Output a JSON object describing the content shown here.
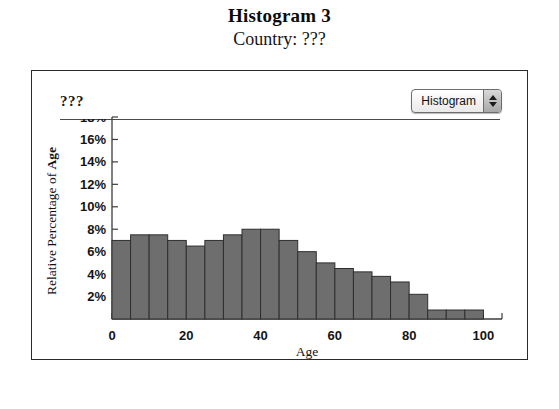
{
  "figure": {
    "title": "Histogram 3",
    "subtitle": "Country: ???"
  },
  "panel": {
    "dataset_label": "???",
    "chart_type_select": {
      "value": "Histogram",
      "stepper_up_icon": "triangle-up-icon",
      "stepper_down_icon": "triangle-down-icon"
    }
  },
  "chart_data": {
    "type": "bar",
    "title": "Histogram 3",
    "subtitle": "Country: ???",
    "xlabel": "Age",
    "ylabel": "Relative Percentage of Age",
    "ylabel_plain": "Relative Percentage of ",
    "ylabel_bold": "Age",
    "grid": false,
    "legend": "none",
    "bin_width": 5,
    "xlim": [
      0,
      105
    ],
    "ylim": [
      0,
      18
    ],
    "xticks": [
      0,
      20,
      40,
      60,
      80,
      100
    ],
    "xtick_labels": [
      "0",
      "20",
      "40",
      "60",
      "80",
      "100"
    ],
    "yticks": [
      2,
      4,
      6,
      8,
      10,
      12,
      14,
      16,
      18
    ],
    "ytick_labels": [
      "2%",
      "4%",
      "6%",
      "8%",
      "10%",
      "12%",
      "14%",
      "16%",
      "18%"
    ],
    "ytick_clipped": "18%",
    "categories": [
      "0-5",
      "5-10",
      "10-15",
      "15-20",
      "20-25",
      "25-30",
      "30-35",
      "35-40",
      "40-45",
      "45-50",
      "50-55",
      "55-60",
      "60-65",
      "65-70",
      "70-75",
      "75-80",
      "80-85",
      "85-90",
      "90-95",
      "95-100"
    ],
    "bin_starts": [
      0,
      5,
      10,
      15,
      20,
      25,
      30,
      35,
      40,
      45,
      50,
      55,
      60,
      65,
      70,
      75,
      80,
      85,
      90,
      95
    ],
    "values": [
      7.0,
      7.5,
      7.5,
      7.0,
      6.5,
      7.0,
      7.5,
      8.0,
      8.0,
      7.0,
      6.0,
      5.0,
      4.5,
      4.2,
      3.8,
      3.3,
      2.2,
      0.8,
      0.8,
      0.8
    ]
  },
  "colors": {
    "bar_fill": "#6e6e6e",
    "bar_stroke": "#2f2f2f",
    "axis": "#3c3c3c",
    "panel_border": "#2a2a2a",
    "text": "#101010"
  }
}
